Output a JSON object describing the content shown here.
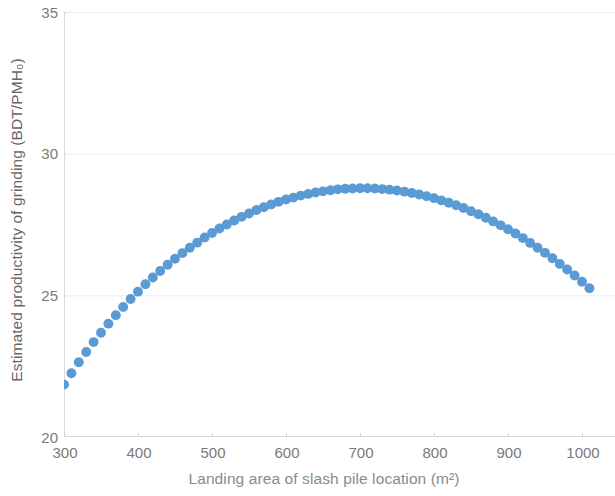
{
  "chart_data": {
    "type": "scatter",
    "title": "",
    "xlabel": "Landing area of slash pile location (m²)",
    "ylabel": "Estimated productivity of grinding (BDT/PMH₀)",
    "xlim": [
      300,
      1015
    ],
    "ylim": [
      20,
      35
    ],
    "xticks": [
      300,
      400,
      500,
      600,
      700,
      800,
      900,
      1000
    ],
    "xticklabels": [
      "300",
      "400",
      "500",
      "600",
      "700",
      "800",
      "900",
      "1000"
    ],
    "yticks": [
      20,
      25,
      30,
      35
    ],
    "yticklabels": [
      "20",
      "25",
      "30",
      "35"
    ],
    "grid": true,
    "grid_axis": "y",
    "legend": false,
    "marker_color": "#5B9BD5",
    "marker_size": 7.5,
    "series": [
      {
        "name": "Estimated productivity of grinding",
        "x": [
          300,
          310,
          320,
          330,
          340,
          350,
          360,
          370,
          380,
          390,
          400,
          410,
          420,
          430,
          440,
          450,
          460,
          470,
          480,
          490,
          500,
          510,
          520,
          530,
          540,
          550,
          560,
          570,
          580,
          590,
          600,
          610,
          620,
          630,
          640,
          650,
          660,
          670,
          680,
          690,
          700,
          710,
          720,
          730,
          740,
          750,
          760,
          770,
          780,
          790,
          800,
          810,
          820,
          830,
          840,
          850,
          860,
          870,
          880,
          890,
          900,
          910,
          920,
          930,
          940,
          950,
          960,
          970,
          980,
          990,
          1000,
          1010
        ],
        "y": [
          21.85,
          22.25,
          22.64,
          23.0,
          23.35,
          23.68,
          24.0,
          24.3,
          24.59,
          24.87,
          25.13,
          25.39,
          25.63,
          25.86,
          26.08,
          26.29,
          26.49,
          26.68,
          26.86,
          27.04,
          27.2,
          27.36,
          27.5,
          27.64,
          27.77,
          27.89,
          28.01,
          28.11,
          28.21,
          28.3,
          28.38,
          28.45,
          28.52,
          28.58,
          28.63,
          28.67,
          28.71,
          28.74,
          28.76,
          28.77,
          28.78,
          28.78,
          28.77,
          28.75,
          28.73,
          28.7,
          28.66,
          28.61,
          28.56,
          28.5,
          28.43,
          28.35,
          28.27,
          28.18,
          28.08,
          27.97,
          27.86,
          27.74,
          27.61,
          27.47,
          27.33,
          27.18,
          27.02,
          26.85,
          26.68,
          26.5,
          26.31,
          26.11,
          25.91,
          25.7,
          25.48,
          25.25
        ]
      }
    ]
  },
  "axes": {
    "y_title": "Estimated productivity of grinding (BDT/PMH₀)",
    "x_title": "Landing area of slash pile location (m²)",
    "y_tick_labels": [
      "35",
      "30",
      "25",
      "20"
    ],
    "x_tick_labels": [
      "300",
      "400",
      "500",
      "600",
      "700",
      "800",
      "900",
      "1000"
    ]
  }
}
